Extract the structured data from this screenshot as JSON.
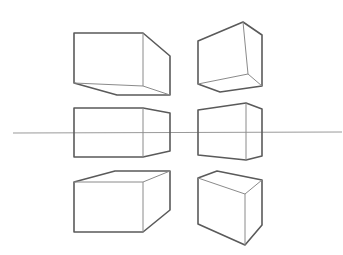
{
  "watermark": "",
  "colors": {
    "outline": "#5a5a5a",
    "inner_edges": "#8a8a8a",
    "horizon": "#9a9a9a",
    "background": "#ffffff"
  },
  "horizon_line": {
    "x1": 13,
    "y1": 133,
    "x2": 342,
    "y2": 132
  },
  "boxes": [
    {
      "id": "top-left",
      "position": "above horizon",
      "view": "seen from below"
    },
    {
      "id": "top-right",
      "position": "above horizon",
      "view": "seen from below"
    },
    {
      "id": "middle-left",
      "position": "on horizon",
      "view": "eye level"
    },
    {
      "id": "middle-right",
      "position": "on horizon",
      "view": "eye level"
    },
    {
      "id": "bottom-left",
      "position": "below horizon",
      "view": "seen from above"
    },
    {
      "id": "bottom-right",
      "position": "below horizon",
      "view": "seen from above"
    }
  ]
}
